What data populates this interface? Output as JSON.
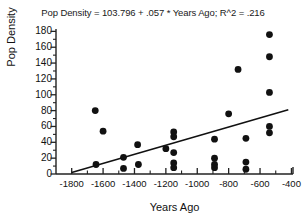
{
  "chart_data": {
    "type": "scatter",
    "title": "Pop Density = 103.796 + .057 * Years Ago; R^2 = .216",
    "xlabel": "Years Ago",
    "ylabel": "Pop Density",
    "xlim": [
      -1900,
      -390
    ],
    "ylim": [
      0,
      183
    ],
    "grid": false,
    "legend": null,
    "xticks": [
      -1800,
      -1600,
      -1400,
      -1200,
      -1000,
      -800,
      -600,
      -400
    ],
    "xtick_labels": [
      "-1800",
      "-1600",
      "-1400",
      "-1200",
      "-1000",
      "-800",
      "-600",
      "-400"
    ],
    "xminorticks": [
      -1700,
      -1500,
      -1300,
      -1100,
      -900,
      -700,
      -500
    ],
    "yticks": [
      0,
      20,
      40,
      60,
      80,
      100,
      120,
      140,
      160,
      180
    ],
    "ytick_labels": [
      "0",
      "20",
      "40",
      "60",
      "80",
      "100",
      "120",
      "140",
      "160",
      "180"
    ],
    "points": [
      {
        "x": -1650,
        "y": 80
      },
      {
        "x": -1645,
        "y": 12
      },
      {
        "x": -1600,
        "y": 54
      },
      {
        "x": -1470,
        "y": 21
      },
      {
        "x": -1470,
        "y": 7
      },
      {
        "x": -1380,
        "y": 37
      },
      {
        "x": -1375,
        "y": 12
      },
      {
        "x": -1200,
        "y": 32
      },
      {
        "x": -1150,
        "y": 53
      },
      {
        "x": -1150,
        "y": 47
      },
      {
        "x": -1150,
        "y": 27
      },
      {
        "x": -1150,
        "y": 14
      },
      {
        "x": -1150,
        "y": 8
      },
      {
        "x": -890,
        "y": 44
      },
      {
        "x": -890,
        "y": 20
      },
      {
        "x": -890,
        "y": 12
      },
      {
        "x": -890,
        "y": 8
      },
      {
        "x": -800,
        "y": 76
      },
      {
        "x": -740,
        "y": 132
      },
      {
        "x": -690,
        "y": 45
      },
      {
        "x": -690,
        "y": 15
      },
      {
        "x": -690,
        "y": 6
      },
      {
        "x": -540,
        "y": 176
      },
      {
        "x": -540,
        "y": 148
      },
      {
        "x": -540,
        "y": 103
      },
      {
        "x": -540,
        "y": 60
      },
      {
        "x": -540,
        "y": 52
      }
    ],
    "regression": {
      "intercept": 103.796,
      "slope": 0.057,
      "r_squared": 0.216,
      "x_start": -1800,
      "y_start": 2,
      "x_end": -420,
      "y_end": 81
    },
    "marker": {
      "shape": "circle",
      "color": "#111111",
      "size": 3.4
    },
    "line_color": "#111111",
    "axis_color": "#222222"
  }
}
